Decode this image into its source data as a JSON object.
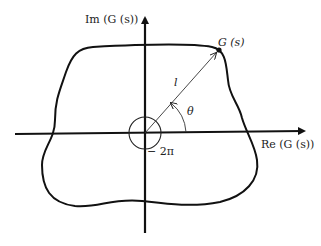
{
  "diagram": {
    "axes": {
      "imag_label": "Im (G (s))",
      "real_label": "Re (G (s))"
    },
    "point_label": "G (s)",
    "vector_label": "l",
    "angle_label": "θ",
    "encirclement_label": "− 2π",
    "colors": {
      "stroke": "#111111",
      "background": "#ffffff"
    }
  }
}
